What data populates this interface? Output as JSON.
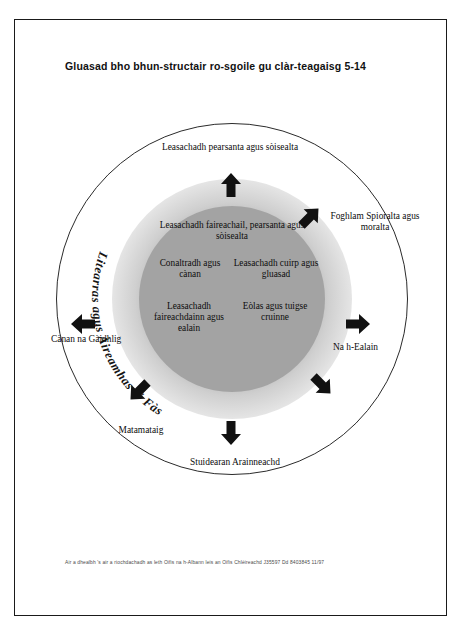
{
  "scan_header": "",
  "document": {
    "title": "Gluasad bho bhun-structair ro-sgoile gu clàr-teagaisg 5-14",
    "footer": "Air a dhealbh 's air a riochdachadh as leth Oifis na h-Albann leis an Oifis Chlèireachd  J35597  Dd 8403845 11/97"
  },
  "diagram": {
    "type": "concentric-circle",
    "arc_label": "Litearras agus Àireamhas a' Fàs",
    "core_items": [
      {
        "id": "core-top",
        "text": "Leasachadh faireachail, pearsanta agus sòisealta"
      },
      {
        "id": "core-mid-l",
        "text": "Conaltradh agus cànan"
      },
      {
        "id": "core-mid-r",
        "text": "Leasachadh cuirp agus gluasad"
      },
      {
        "id": "core-bot-l",
        "text": "Leasachadh faireachdainn agus ealain"
      },
      {
        "id": "core-bot-r",
        "text": "Eòlas agus tuigse cruinne"
      }
    ],
    "outer_items": [
      {
        "id": "lab-top",
        "position": "north",
        "text": "Leasachadh pearsanta agus sòisealta"
      },
      {
        "id": "lab-ne",
        "position": "north-east",
        "text": "Foghlam Spioralta agus moralta"
      },
      {
        "id": "lab-e",
        "position": "east",
        "text": "Na h-Ealain"
      },
      {
        "id": "lab-s",
        "position": "south",
        "text": "Stuidearan Arainneachd"
      },
      {
        "id": "lab-sw",
        "position": "south-west",
        "text": "Matamataig"
      },
      {
        "id": "lab-w",
        "position": "west",
        "text": "Cànan na Gàidhlig"
      }
    ],
    "arrows": [
      {
        "id": "arr-n",
        "direction": "up"
      },
      {
        "id": "arr-ne",
        "direction": "up-right"
      },
      {
        "id": "arr-e",
        "direction": "right"
      },
      {
        "id": "arr-se",
        "direction": "down-right"
      },
      {
        "id": "arr-s",
        "direction": "down"
      },
      {
        "id": "arr-sw",
        "direction": "down-left"
      },
      {
        "id": "arr-w",
        "direction": "left"
      }
    ],
    "colors": {
      "core_fill": "#a3a3a3",
      "halo_fill": "#cfcfcf",
      "outline": "#2b2b2b",
      "text": "#0d0d0d"
    }
  }
}
